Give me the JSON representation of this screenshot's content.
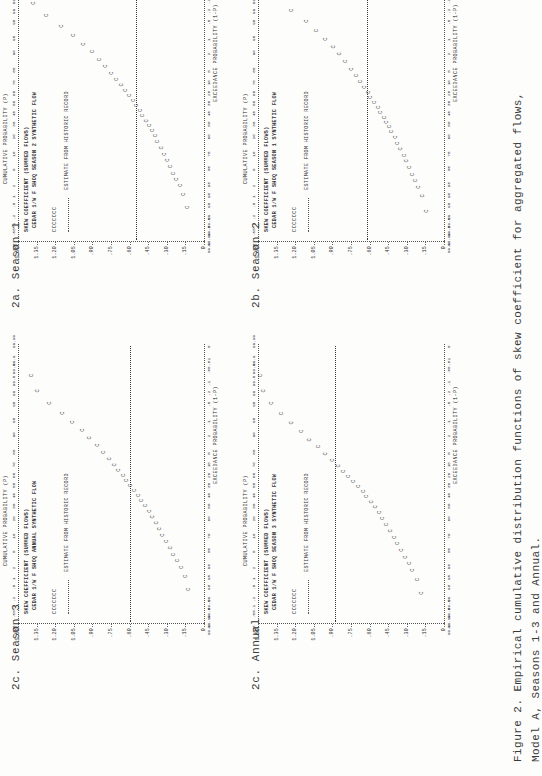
{
  "page": {
    "width": 541,
    "height": 776,
    "rotation_note": "page scanned rotated 90 degrees clockwise",
    "background": "#fdfdfc",
    "ink": "#2b2b2b"
  },
  "figure_caption": {
    "label": "Figure 2.",
    "line1": "Empirical cumulative distribution functions of skew coefficient for aggregated flows,",
    "line2": "Model A, Seasons 1-3 and Annual."
  },
  "panels": [
    {
      "id": "2a",
      "subcaption": "2a.  Season 1",
      "title": "SKEW COEFFICIENT (SUMMED FLOWS)",
      "subtitle": "CEDAR 1/W F SHOQ SEASON 1 SYNTHETIC FLOW",
      "legend_marker": "CCCCCCC",
      "legend_dash_label": "ESTIMATE FROM HISTORIC RECORD",
      "ylabel": "",
      "yticks": [
        "1.50",
        "1.35",
        "1.20",
        "1.05",
        ".90",
        ".75",
        ".60",
        ".45",
        ".30",
        ".15",
        "0"
      ],
      "ylim": [
        0,
        1.5
      ],
      "xlabel_top": "CUMULATIVE PROBABILITY (P)",
      "xlabel_bottom": "EXCEEDANCE PROBABILITY (1-P)",
      "xticks": [
        "0",
        ".01",
        ".05",
        ".1",
        ".2",
        ".5",
        "1",
        "2",
        "5",
        "10",
        "20",
        "30",
        "40",
        "50",
        "60",
        "70",
        "80",
        "90",
        "95",
        "98",
        "99",
        "99.5",
        "99.8",
        "99.9",
        "99.99"
      ],
      "historic_estimate_value": 0.62
    },
    {
      "id": "2b",
      "subcaption": "2b.  Season 2",
      "title": "SKEW COEFFICIENT (SUMMED FLOWS)",
      "subtitle": "CEDAR 1/W F SHOQ SEASON 2 SYNTHETIC FLOW",
      "legend_marker": "CCCCCCC",
      "legend_dash_label": "ESTIMATE FROM HISTORIC RECORD",
      "ylabel": "",
      "yticks": [
        "1.50",
        "1.35",
        "1.20",
        "1.05",
        ".90",
        ".75",
        ".60",
        ".45",
        ".30",
        ".15",
        "0"
      ],
      "ylim": [
        0,
        1.5
      ],
      "xlabel_top": "CUMULATIVE PROBABILITY (P)",
      "xlabel_bottom": "EXCEEDANCE PROBABILITY (1-P)",
      "xticks": [
        "0",
        ".01",
        ".05",
        ".1",
        ".2",
        ".5",
        "1",
        "2",
        "5",
        "10",
        "20",
        "30",
        "40",
        "50",
        "60",
        "70",
        "80",
        "90",
        "95",
        "98",
        "99",
        "99.5",
        "99.8",
        "99.9",
        "99.99"
      ],
      "historic_estimate_value": 0.55
    },
    {
      "id": "2c",
      "subcaption": "2c.  Season 3",
      "title": "SKEW COEFFICIENT (SUMMED FLOWS)",
      "subtitle": "CEDAR 1/W F SHOQ SEASON 3 SYNTHETIC FLOW",
      "legend_marker": "CCCCCCC",
      "legend_dash_label": "ESTIMATE FROM HISTORIC RECORD",
      "ylabel": "",
      "yticks": [
        "1.50",
        "1.35",
        "1.20",
        "1.05",
        ".90",
        ".75",
        ".60",
        ".45",
        ".30",
        ".15",
        "0"
      ],
      "ylim": [
        0,
        1.5
      ],
      "xlabel_top": "CUMULATIVE PROBABILITY (P)",
      "xlabel_bottom": "EXCEEDANCE PROBABILITY (1-P)",
      "xticks": [
        "0",
        ".01",
        ".05",
        ".1",
        ".2",
        ".5",
        "1",
        "2",
        "5",
        "10",
        "20",
        "30",
        "40",
        "50",
        "60",
        "70",
        "80",
        "90",
        "95",
        "98",
        "99",
        "99.5",
        "99.8",
        "99.9",
        "99.99"
      ],
      "historic_estimate_value": 0.88
    },
    {
      "id": "2d",
      "subcaption": "2c.  Annual",
      "title": "SKEW COEFFICIENT (SUMMED FLOWS)",
      "subtitle": "CEDAR 1/W F SHOQ ANNUAL SYNTHETIC FLOW",
      "legend_marker": "CCCCCCC",
      "legend_dash_label": "ESTIMATE FROM HISTORIC RECORD",
      "ylabel": "",
      "yticks": [
        "1.50",
        "1.35",
        "1.20",
        "1.05",
        ".90",
        ".75",
        ".60",
        ".45",
        ".30",
        ".15",
        "0"
      ],
      "ylim": [
        0,
        1.5
      ],
      "xlabel_top": "CUMULATIVE PROBABILITY (P)",
      "xlabel_bottom": "EXCEEDANCE PROBABILITY (1-P)",
      "xticks": [
        "0",
        ".01",
        ".05",
        ".1",
        ".2",
        ".5",
        "1",
        "2",
        "5",
        "10",
        "20",
        "30",
        "40",
        "50",
        "60",
        "70",
        "80",
        "90",
        "95",
        "98",
        "99",
        "99.5",
        "99.8",
        "99.9",
        "99.99"
      ],
      "historic_estimate_value": 0.6
    }
  ],
  "chart_data": [
    {
      "type": "scatter",
      "id": "2a",
      "title": "SKEW COEFFICIENT (SUMMED FLOWS) - CEDAR 1/W F SHOQ SEASON 1 SYNTHETIC FLOW",
      "xlabel": "CUMULATIVE PROBABILITY (P)",
      "ylabel": "SKEW COEFFICIENT",
      "ylim": [
        0,
        1.5
      ],
      "marker": "C",
      "grid": false,
      "legend": [
        "CCCCCCC synthetic flow",
        "ESTIMATE FROM HISTORIC RECORD (dashed)"
      ],
      "reference_line": 0.62,
      "points_xy": [
        [
          0.3,
          0.13
        ],
        [
          0.9,
          0.16
        ],
        [
          1.6,
          0.19
        ],
        [
          2.4,
          0.22
        ],
        [
          3.4,
          0.24
        ],
        [
          5.0,
          0.27
        ],
        [
          7.0,
          0.29
        ],
        [
          9.0,
          0.31
        ],
        [
          12.0,
          0.34
        ],
        [
          15.0,
          0.36
        ],
        [
          19.0,
          0.38
        ],
        [
          23.0,
          0.41
        ],
        [
          27.0,
          0.43
        ],
        [
          31.0,
          0.45
        ],
        [
          35.0,
          0.47
        ],
        [
          40.0,
          0.5
        ],
        [
          45.0,
          0.52
        ],
        [
          50.0,
          0.55
        ],
        [
          55.0,
          0.58
        ],
        [
          60.0,
          0.6
        ],
        [
          65.0,
          0.63
        ],
        [
          70.0,
          0.66
        ],
        [
          75.0,
          0.69
        ],
        [
          80.0,
          0.73
        ],
        [
          85.0,
          0.78
        ],
        [
          89.0,
          0.83
        ],
        [
          92.0,
          0.88
        ],
        [
          94.5,
          0.94
        ],
        [
          96.5,
          1.02
        ],
        [
          98.0,
          1.1
        ],
        [
          99.0,
          1.22
        ],
        [
          99.6,
          1.33
        ]
      ]
    },
    {
      "type": "scatter",
      "id": "2b",
      "title": "SKEW COEFFICIENT (SUMMED FLOWS) - CEDAR 1/W F SHOQ SEASON 2 SYNTHETIC FLOW",
      "xlabel": "CUMULATIVE PROBABILITY (P)",
      "ylabel": "SKEW COEFFICIENT",
      "ylim": [
        0,
        1.5
      ],
      "marker": "C",
      "grid": false,
      "legend": [
        "CCCCCCC synthetic flow",
        "ESTIMATE FROM HISTORIC RECORD (dashed)"
      ],
      "reference_line": 0.55,
      "points_xy": [
        [
          0.4,
          0.12
        ],
        [
          1.0,
          0.15
        ],
        [
          1.8,
          0.18
        ],
        [
          2.6,
          0.21
        ],
        [
          3.6,
          0.23
        ],
        [
          5.2,
          0.26
        ],
        [
          7.2,
          0.28
        ],
        [
          9.5,
          0.31
        ],
        [
          12.5,
          0.33
        ],
        [
          16.0,
          0.36
        ],
        [
          20.0,
          0.38
        ],
        [
          24.0,
          0.4
        ],
        [
          28.0,
          0.43
        ],
        [
          32.0,
          0.45
        ],
        [
          37.0,
          0.48
        ],
        [
          42.0,
          0.5
        ],
        [
          47.0,
          0.53
        ],
        [
          52.0,
          0.56
        ],
        [
          57.0,
          0.59
        ],
        [
          62.0,
          0.62
        ],
        [
          67.0,
          0.65
        ],
        [
          72.0,
          0.69
        ],
        [
          77.0,
          0.73
        ],
        [
          82.0,
          0.78
        ],
        [
          86.0,
          0.83
        ],
        [
          90.0,
          0.89
        ],
        [
          93.0,
          0.96
        ],
        [
          95.5,
          1.04
        ],
        [
          97.3,
          1.14
        ],
        [
          98.6,
          1.26
        ],
        [
          99.4,
          1.36
        ],
        [
          99.8,
          1.38
        ]
      ]
    },
    {
      "type": "scatter",
      "id": "2c",
      "title": "SKEW COEFFICIENT (SUMMED FLOWS) - CEDAR 1/W F SHOQ SEASON 3 SYNTHETIC FLOW",
      "xlabel": "CUMULATIVE PROBABILITY (P)",
      "ylabel": "SKEW COEFFICIENT",
      "ylim": [
        0,
        1.5
      ],
      "marker": "C",
      "grid": false,
      "legend": [
        "CCCCCCC synthetic flow",
        "ESTIMATE FROM HISTORIC RECORD (dashed)"
      ],
      "reference_line": 0.88,
      "points_xy": [
        [
          0.3,
          0.17
        ],
        [
          0.8,
          0.2
        ],
        [
          1.5,
          0.24
        ],
        [
          2.3,
          0.27
        ],
        [
          3.3,
          0.3
        ],
        [
          4.8,
          0.33
        ],
        [
          6.8,
          0.36
        ],
        [
          9.0,
          0.39
        ],
        [
          12.0,
          0.42
        ],
        [
          15.5,
          0.45
        ],
        [
          19.5,
          0.48
        ],
        [
          24.0,
          0.51
        ],
        [
          28.5,
          0.54
        ],
        [
          33.0,
          0.57
        ],
        [
          38.0,
          0.61
        ],
        [
          43.0,
          0.64
        ],
        [
          48.0,
          0.68
        ],
        [
          53.0,
          0.72
        ],
        [
          58.0,
          0.76
        ],
        [
          63.0,
          0.8
        ],
        [
          68.0,
          0.84
        ],
        [
          73.0,
          0.89
        ],
        [
          78.0,
          0.94
        ],
        [
          83.0,
          1.0
        ],
        [
          87.0,
          1.07
        ],
        [
          91.0,
          1.14
        ],
        [
          94.0,
          1.22
        ],
        [
          96.3,
          1.3
        ],
        [
          98.0,
          1.38
        ],
        [
          99.1,
          1.44
        ],
        [
          99.7,
          1.47
        ]
      ]
    },
    {
      "type": "scatter",
      "id": "2d",
      "title": "SKEW COEFFICIENT (SUMMED FLOWS) - CEDAR 1/W F SHOQ ANNUAL SYNTHETIC FLOW",
      "xlabel": "CUMULATIVE PROBABILITY (P)",
      "ylabel": "SKEW COEFFICIENT",
      "ylim": [
        0,
        1.5
      ],
      "marker": "C",
      "grid": false,
      "legend": [
        "CCCCCCC synthetic flow",
        "ESTIMATE FROM HISTORIC RECORD (dashed)"
      ],
      "reference_line": 0.6,
      "points_xy": [
        [
          0.4,
          0.11
        ],
        [
          1.0,
          0.14
        ],
        [
          1.8,
          0.17
        ],
        [
          2.7,
          0.2
        ],
        [
          3.8,
          0.23
        ],
        [
          5.4,
          0.26
        ],
        [
          7.5,
          0.29
        ],
        [
          10.0,
          0.32
        ],
        [
          13.0,
          0.35
        ],
        [
          16.5,
          0.37
        ],
        [
          20.5,
          0.4
        ],
        [
          25.0,
          0.43
        ],
        [
          29.5,
          0.46
        ],
        [
          34.0,
          0.49
        ],
        [
          39.0,
          0.52
        ],
        [
          44.0,
          0.55
        ],
        [
          49.0,
          0.58
        ],
        [
          54.0,
          0.61
        ],
        [
          59.0,
          0.64
        ],
        [
          64.0,
          0.68
        ],
        [
          69.0,
          0.71
        ],
        [
          74.0,
          0.75
        ],
        [
          79.0,
          0.8
        ],
        [
          84.0,
          0.85
        ],
        [
          88.0,
          0.91
        ],
        [
          91.5,
          0.97
        ],
        [
          94.2,
          1.05
        ],
        [
          96.4,
          1.13
        ],
        [
          98.0,
          1.23
        ],
        [
          99.1,
          1.33
        ],
        [
          99.7,
          1.38
        ]
      ]
    }
  ]
}
